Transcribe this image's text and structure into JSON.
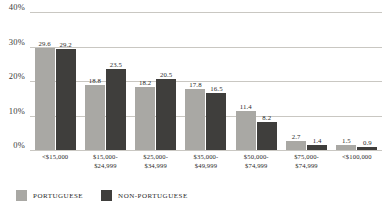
{
  "chart_data": {
    "type": "bar",
    "title": "",
    "subtitle": "",
    "xlabel": "",
    "ylabel": "",
    "ylim": [
      0,
      40
    ],
    "yticks": [
      0,
      10,
      20,
      30,
      40
    ],
    "ytick_labels": [
      "0%",
      "10%",
      "20%",
      "30%",
      "40%"
    ],
    "grid": true,
    "legend_position": "bottom-left",
    "categories": [
      "<$15,000",
      "$15,000-$24,999",
      "$25,000-$34,999",
      "$35,000-$49,999",
      "$50,000-$74,999",
      "$75,000-$74,999",
      "<$100,000"
    ],
    "category_lines": [
      [
        "<$15,000"
      ],
      [
        "$15,000-",
        "$24,999"
      ],
      [
        "$25,000-",
        "$34,999"
      ],
      [
        "$35,000-",
        "$49,999"
      ],
      [
        "$50,000-",
        "$74,999"
      ],
      [
        "$75,000-",
        "$74,999"
      ],
      [
        "<$100,000"
      ]
    ],
    "series": [
      {
        "name": "PORTUGUESE",
        "color": "#a9a8a4",
        "values": [
          29.6,
          18.8,
          18.2,
          17.8,
          11.4,
          2.7,
          1.5
        ],
        "labels": [
          "29.6",
          "18.8",
          "18.2",
          "17.8",
          "11.4",
          "2.7",
          "1.5"
        ]
      },
      {
        "name": "NON-PORTUGUESE",
        "color": "#3f3e3c",
        "values": [
          29.2,
          23.5,
          20.5,
          16.5,
          8.2,
          1.4,
          0.9
        ],
        "labels": [
          "29.2",
          "23.5",
          "20.5",
          "16.5",
          "8.2",
          "1.4",
          "0.9"
        ]
      }
    ]
  },
  "legend": {
    "items": [
      {
        "label": "PORTUGUESE",
        "color": "#a9a8a4"
      },
      {
        "label": "NON-PORTUGUESE",
        "color": "#3f3e3c"
      }
    ]
  }
}
